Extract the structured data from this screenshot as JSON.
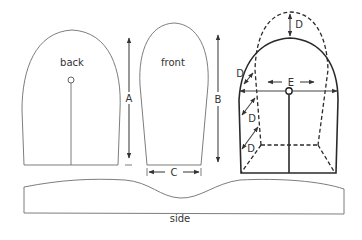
{
  "diagram": {
    "pieces": {
      "back": {
        "label": "back"
      },
      "front": {
        "label": "front"
      },
      "side": {
        "label": "side"
      }
    },
    "dimensions": {
      "A": "A",
      "B": "B",
      "C": "C",
      "D": "D",
      "E": "E"
    },
    "colors": {
      "line": "#6e6e6e",
      "heavy": "#2a2a2a",
      "background": "#ffffff"
    }
  }
}
